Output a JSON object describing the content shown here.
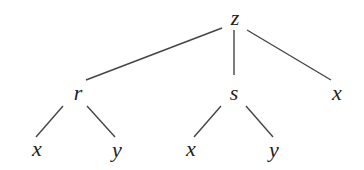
{
  "tree": {
    "nodes": [
      {
        "id": "z",
        "label": "z",
        "x": 235,
        "y": 18
      },
      {
        "id": "r",
        "label": "r",
        "x": 78,
        "y": 93
      },
      {
        "id": "s",
        "label": "s",
        "x": 234,
        "y": 93
      },
      {
        "id": "x1",
        "label": "x",
        "x": 337,
        "y": 93
      },
      {
        "id": "x2",
        "label": "x",
        "x": 37,
        "y": 149
      },
      {
        "id": "y1",
        "label": "y",
        "x": 117,
        "y": 150
      },
      {
        "id": "x3",
        "label": "x",
        "x": 191,
        "y": 149
      },
      {
        "id": "y2",
        "label": "y",
        "x": 274,
        "y": 150
      }
    ],
    "edges": [
      {
        "from": "z",
        "to": "r",
        "x1": 222,
        "y1": 28,
        "x2": 86,
        "y2": 80
      },
      {
        "from": "z",
        "to": "s",
        "x1": 234,
        "y1": 30,
        "x2": 234,
        "y2": 75
      },
      {
        "from": "z",
        "to": "x1",
        "x1": 247,
        "y1": 30,
        "x2": 331,
        "y2": 80
      },
      {
        "from": "r",
        "to": "x2",
        "x1": 63,
        "y1": 106,
        "x2": 36,
        "y2": 137
      },
      {
        "from": "r",
        "to": "y1",
        "x1": 87,
        "y1": 106,
        "x2": 115,
        "y2": 137
      },
      {
        "from": "s",
        "to": "x3",
        "x1": 221,
        "y1": 106,
        "x2": 194,
        "y2": 137
      },
      {
        "from": "s",
        "to": "y2",
        "x1": 246,
        "y1": 106,
        "x2": 273,
        "y2": 137
      }
    ]
  }
}
